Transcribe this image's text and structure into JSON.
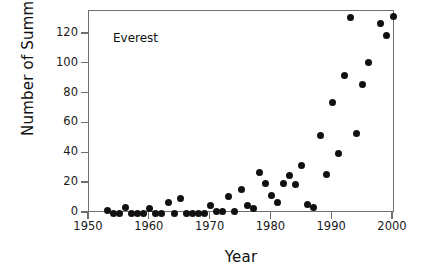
{
  "chart_data": {
    "type": "scatter",
    "title": "",
    "annotation": "Everest",
    "xlabel": "Year",
    "ylabel": "Number of Summits",
    "xlim": [
      1947.5,
      2001.8
    ],
    "ylim": [
      -6,
      135
    ],
    "xticks": [
      1950,
      1960,
      1970,
      1980,
      1990,
      2000
    ],
    "yticks": [
      0,
      20,
      40,
      60,
      80,
      100,
      120
    ],
    "grid": false,
    "legend": null,
    "marker": {
      "shape": "circle",
      "color": "#111111",
      "size": 7
    },
    "series": [
      {
        "name": "Everest",
        "points": [
          {
            "x": 1953,
            "y": 2
          },
          {
            "x": 1954,
            "y": 0
          },
          {
            "x": 1955,
            "y": 0
          },
          {
            "x": 1956,
            "y": 4
          },
          {
            "x": 1957,
            "y": 0
          },
          {
            "x": 1958,
            "y": 0
          },
          {
            "x": 1959,
            "y": 0
          },
          {
            "x": 1960,
            "y": 3
          },
          {
            "x": 1961,
            "y": 0
          },
          {
            "x": 1962,
            "y": 0
          },
          {
            "x": 1963,
            "y": 7
          },
          {
            "x": 1964,
            "y": 0
          },
          {
            "x": 1965,
            "y": 10
          },
          {
            "x": 1966,
            "y": 0
          },
          {
            "x": 1967,
            "y": 0
          },
          {
            "x": 1968,
            "y": 0
          },
          {
            "x": 1969,
            "y": 0
          },
          {
            "x": 1970,
            "y": 5
          },
          {
            "x": 1971,
            "y": 1
          },
          {
            "x": 1972,
            "y": 1
          },
          {
            "x": 1973,
            "y": 11
          },
          {
            "x": 1974,
            "y": 1
          },
          {
            "x": 1975,
            "y": 16
          },
          {
            "x": 1976,
            "y": 5
          },
          {
            "x": 1977,
            "y": 3
          },
          {
            "x": 1978,
            "y": 27
          },
          {
            "x": 1979,
            "y": 20
          },
          {
            "x": 1980,
            "y": 12
          },
          {
            "x": 1981,
            "y": 7
          },
          {
            "x": 1982,
            "y": 20
          },
          {
            "x": 1983,
            "y": 25
          },
          {
            "x": 1984,
            "y": 19
          },
          {
            "x": 1985,
            "y": 32
          },
          {
            "x": 1986,
            "y": 6
          },
          {
            "x": 1987,
            "y": 4
          },
          {
            "x": 1988,
            "y": 52
          },
          {
            "x": 1989,
            "y": 26
          },
          {
            "x": 1990,
            "y": 74
          },
          {
            "x": 1991,
            "y": 40
          },
          {
            "x": 1992,
            "y": 92
          },
          {
            "x": 1993,
            "y": 131
          },
          {
            "x": 1994,
            "y": 53
          },
          {
            "x": 1995,
            "y": 86
          },
          {
            "x": 1996,
            "y": 101
          },
          {
            "x": 1998,
            "y": 127
          },
          {
            "x": 1999,
            "y": 119
          },
          {
            "x": 2000,
            "y": 132
          }
        ]
      }
    ]
  }
}
